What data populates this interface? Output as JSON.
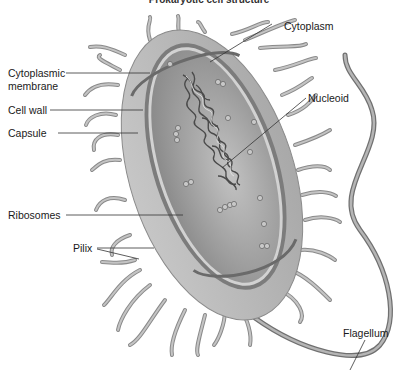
{
  "title": "Prokaryotic cell structure",
  "labels": {
    "cytoplasm": "Cytoplasm",
    "cytoplasmic_membrane_1": "Cytoplasmic",
    "cytoplasmic_membrane_2": "membrane",
    "cell_wall": "Cell wall",
    "capsule": "Capsule",
    "nucleoid": "Nucleoid",
    "ribosomes": "Ribosomes",
    "pilix": "Pilix",
    "flagellum": "Flagellum"
  },
  "colors": {
    "capsule": "#b8b8b8",
    "cytoplasm": "#9a9a9a",
    "membrane": "#6a6a6a",
    "pili": "#a8a8a8",
    "leader_line": "#333333"
  }
}
